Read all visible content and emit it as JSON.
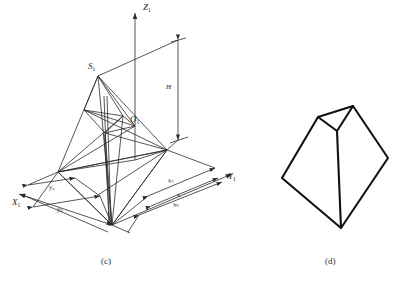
{
  "figure": {
    "panels": [
      {
        "caption": "(c)",
        "caption_pos": [
          101,
          258
        ],
        "type": "perspective-projection-diagram",
        "axes": [
          {
            "name": "z-axis",
            "label": "Z",
            "sub": "1",
            "label_pos": [
              143,
              3
            ]
          },
          {
            "name": "y-axis",
            "label": "Y",
            "sub": "1",
            "label_pos": [
              228,
              175
            ]
          },
          {
            "name": "x-axis",
            "label": "X",
            "sub": "1",
            "label_pos": [
              12,
              200
            ]
          }
        ],
        "points": [
          {
            "name": "perspective-center",
            "label": "S",
            "sub": "1",
            "label_pos": [
              88,
              63
            ]
          },
          {
            "name": "principal-point",
            "label": "O",
            "sub": "1",
            "label_pos": [
              130,
              116
            ]
          }
        ],
        "dimensions": [
          {
            "name": "flight-height",
            "label": "H",
            "sub": "",
            "label_pos": [
              166,
              86
            ],
            "orientation": "vertical"
          },
          {
            "name": "dim-x1",
            "label": "x",
            "sub": "1",
            "label_pos": [
              168,
              179
            ],
            "orientation": "oblique"
          },
          {
            "name": "dim-x",
            "label": "x",
            "sub": "",
            "label_pos": [
              177,
              194
            ],
            "orientation": "oblique"
          },
          {
            "name": "dim-xb",
            "label": "x",
            "sub": "b",
            "label_pos": [
              173,
              203
            ],
            "orientation": "oblique"
          },
          {
            "name": "dim-ya",
            "label": "y",
            "sub": "a",
            "label_pos": [
              49,
              186
            ],
            "orientation": "oblique"
          },
          {
            "name": "dim-yb",
            "label": "y",
            "sub": "b",
            "label_pos": [
              57,
              208
            ],
            "orientation": "oblique"
          }
        ]
      },
      {
        "caption": "(d)",
        "caption_pos": [
          325,
          258
        ],
        "type": "polyhedron-outline",
        "vertices": {
          "top-right-apex": [
            353,
            106
          ],
          "top-left-apex": [
            318,
            117
          ],
          "center-junction": [
            337,
            131
          ],
          "left-corner": [
            282,
            178
          ],
          "right-corner": [
            388,
            158
          ],
          "bottom-apex": [
            341,
            228
          ]
        }
      }
    ],
    "colors": {
      "line": "#2b2b2b",
      "heavy_line": "#111111",
      "background": "#ffffff",
      "text": "#1a1a1a"
    }
  }
}
